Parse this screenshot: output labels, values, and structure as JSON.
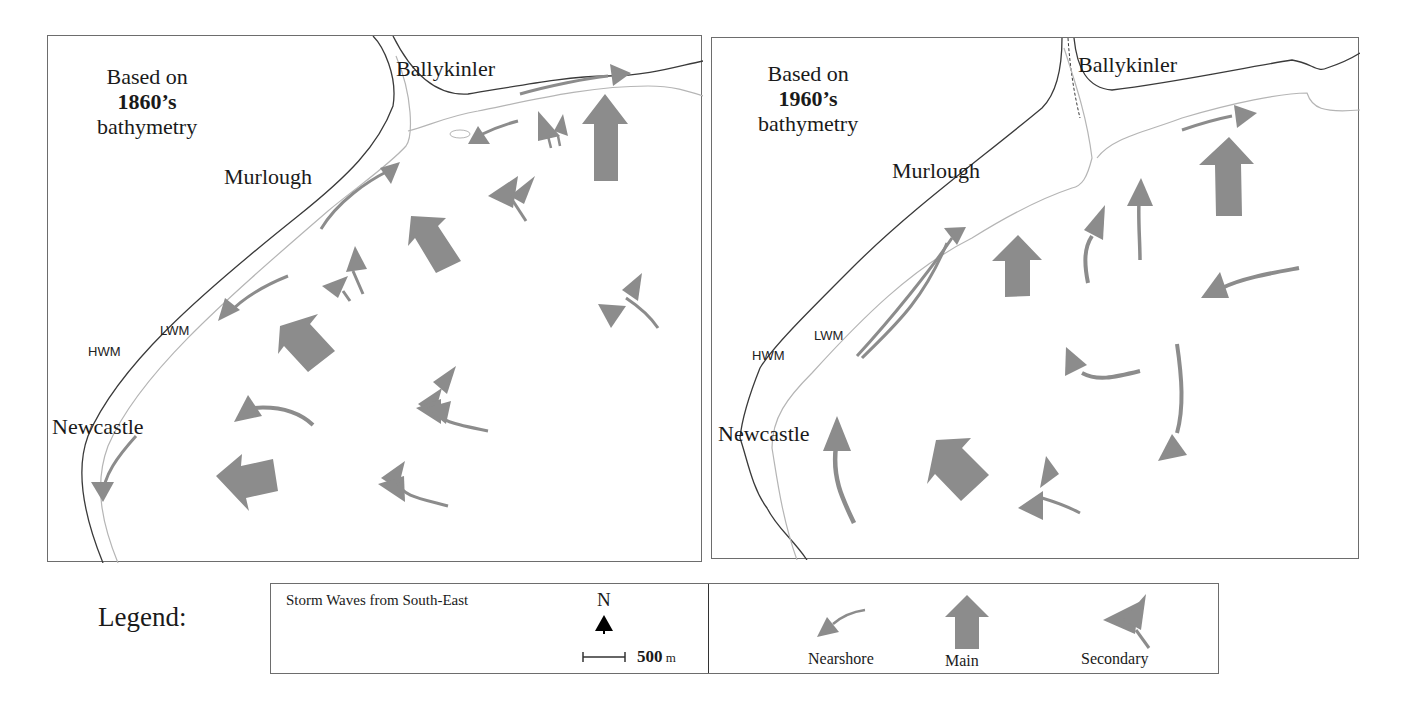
{
  "colors": {
    "arrow": "#8c8c8c",
    "hwm_line": "#3a3a3a",
    "lwm_line": "#b5b5b5",
    "frame": "#6d6d6d"
  },
  "maps": [
    {
      "id": "left",
      "title_prefix": "Based on",
      "year": "1860’s",
      "title_suffix": "bathymetry",
      "places": {
        "north": "Ballykinler",
        "mid": "Murlough",
        "south": "Newcastle"
      },
      "shoreline_labels": {
        "hwm": "HWM",
        "lwm": "LWM"
      },
      "arrows": {
        "nearshore": 5,
        "main": 5,
        "secondary": 7
      }
    },
    {
      "id": "right",
      "title_prefix": "Based on",
      "year": "1960’s",
      "title_suffix": "bathymetry",
      "places": {
        "north": "Ballykinler",
        "mid": "Murlough",
        "south": "Newcastle"
      },
      "shoreline_labels": {
        "hwm": "HWM",
        "lwm": "LWM"
      },
      "arrows": {
        "nearshore": 9,
        "main": 3,
        "secondary": 1
      }
    }
  ],
  "legend": {
    "caption": "Legend:",
    "condition": "Storm Waves from South-East",
    "north_label": "N",
    "north_icon": "north-arrow-icon",
    "scale_value": "500",
    "scale_unit": "m",
    "items": [
      {
        "label": "Nearshore",
        "icon": "nearshore-arrow-icon"
      },
      {
        "label": "Main",
        "icon": "main-arrow-icon"
      },
      {
        "label": "Secondary",
        "icon": "secondary-arrow-icon"
      }
    ]
  }
}
